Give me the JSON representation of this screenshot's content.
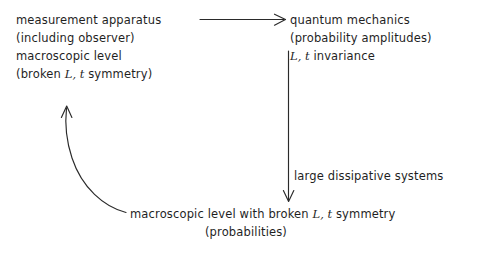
{
  "diagram": {
    "background_color": "#ffffff",
    "ink_color": "#2a2a2a",
    "nodes": [
      {
        "id": "measurement",
        "lines": [
          "measurement apparatus",
          "(including observer)",
          "macroscopic level",
          "(broken "
        ],
        "line_1": "measurement apparatus",
        "line_2": "(including observer)",
        "line_3": "macroscopic level",
        "line_4_pre": "(broken ",
        "line_4_sym": "L, t",
        "line_4_post": " symmetry)"
      },
      {
        "id": "quantum",
        "line_1": "quantum mechanics",
        "line_2": "(probability amplitudes)",
        "line_3_sym": "L, t",
        "line_3_post": " invariance"
      },
      {
        "id": "macroscopic-broken",
        "line_1_pre": "macroscopic  level with broken ",
        "line_1_sym": "L, t",
        "line_1_post": " symmetry",
        "line_2": "(probabilities)"
      }
    ],
    "edges": [
      {
        "id": "measurement-to-quantum",
        "label": "",
        "from": "measurement",
        "to": "quantum",
        "style": "straight-horizontal-arrow"
      },
      {
        "id": "quantum-to-macroscopic",
        "label": "large dissipative systems",
        "from": "quantum",
        "to": "macroscopic-broken",
        "style": "straight-vertical-arrow"
      },
      {
        "id": "macroscopic-to-measurement",
        "label": "",
        "from": "macroscopic-broken",
        "to": "measurement",
        "style": "curved-arrow"
      }
    ],
    "edge_label_dissipative": "large dissipative systems"
  }
}
